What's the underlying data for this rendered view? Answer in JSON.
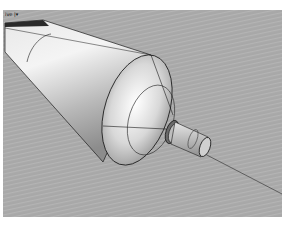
{
  "window": {
    "top_caption": "",
    "bottom_caption": ""
  },
  "viewport": {
    "label": "ive |",
    "dropdown_glyph": "▾",
    "background": "#a9a9a9",
    "display_mode": "shaded",
    "object": "lathe-revolved tapered cylinder with conical nozzle and tube"
  },
  "colors": {
    "edge": "#1a1a1a",
    "surface_light": "#f2f2f2",
    "surface_mid": "#c4c4c4",
    "surface_dark": "#8a8a8a"
  }
}
